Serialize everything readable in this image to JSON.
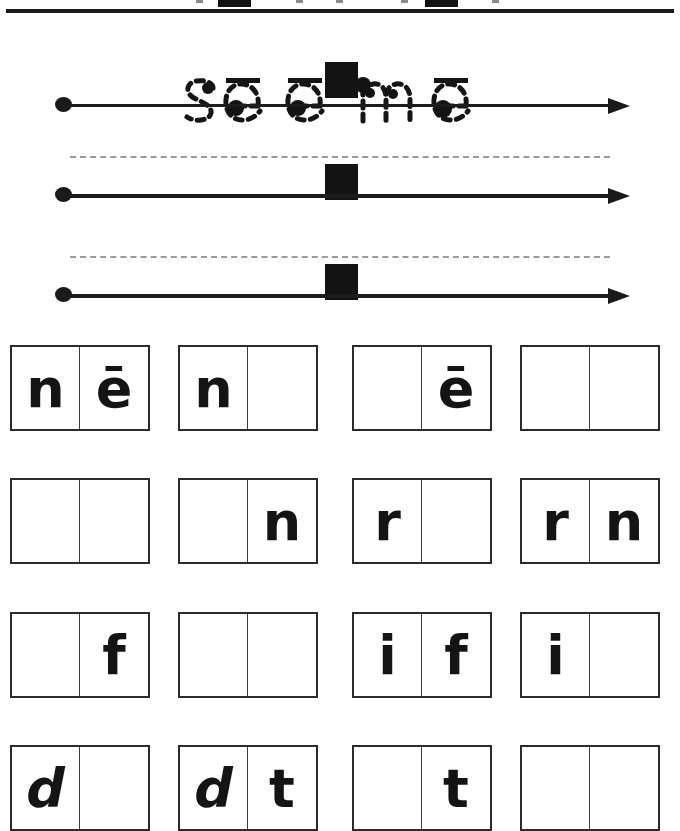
{
  "worksheet": {
    "title": "see me",
    "kind": "handwriting-and-word-building-worksheet",
    "ink_color": "#141414",
    "paper_color": "#ffffff",
    "guide_color": "#9a9a9a"
  },
  "top_strip": {
    "description": "cut-off bottom edge of the row above",
    "squares": [
      {
        "x": 218
      },
      {
        "x": 425
      }
    ],
    "ticks": [
      {
        "x": 196
      },
      {
        "x": 296
      },
      {
        "x": 336
      },
      {
        "x": 401
      },
      {
        "x": 492
      }
    ],
    "rule": {
      "x": 6,
      "y": 9,
      "width": 668,
      "height": 4
    }
  },
  "practice_lines": [
    {
      "index": 1,
      "has_traced_word": true,
      "traced_word": "see me",
      "baseline_y": 88,
      "midline": false,
      "separator_square": {
        "x": 325,
        "y": 46
      },
      "arrow": true,
      "start_dot": true
    },
    {
      "index": 2,
      "has_traced_word": false,
      "traced_word": "",
      "baseline_y": 178,
      "midline": true,
      "midline_y": 140,
      "separator_square": {
        "x": 325,
        "y": 148
      },
      "arrow": true,
      "start_dot": true
    },
    {
      "index": 3,
      "has_traced_word": false,
      "traced_word": "",
      "baseline_y": 278,
      "midline": true,
      "midline_y": 240,
      "separator_square": {
        "x": 325,
        "y": 248
      },
      "arrow": true,
      "start_dot": true
    }
  ],
  "traced_word": {
    "text": "see me",
    "word_1": "see",
    "word_2": "me",
    "letters": [
      {
        "char": "s",
        "macron": false,
        "start_dot": true
      },
      {
        "char": "e",
        "macron": true,
        "start_dot": true
      },
      {
        "char": "e",
        "macron": true,
        "start_dot": true
      },
      {
        "char": "m",
        "macron": false,
        "start_dot": true
      },
      {
        "char": "e",
        "macron": true,
        "start_dot": true
      }
    ]
  },
  "letter_grid": {
    "columns": 4,
    "rows": 4,
    "cells_per_box": 2,
    "row_labels": [
      "ne",
      "rn",
      "if",
      "dt"
    ],
    "rows_data": [
      {
        "row": 1,
        "boxes": [
          {
            "left": "n",
            "right": "ē"
          },
          {
            "left": "n",
            "right": ""
          },
          {
            "left": "",
            "right": "ē"
          },
          {
            "left": "",
            "right": ""
          }
        ]
      },
      {
        "row": 2,
        "boxes": [
          {
            "left": "",
            "right": ""
          },
          {
            "left": "",
            "right": "n"
          },
          {
            "left": "r",
            "right": ""
          },
          {
            "left": "r",
            "right": "n"
          }
        ]
      },
      {
        "row": 3,
        "boxes": [
          {
            "left": "",
            "right": "f"
          },
          {
            "left": "",
            "right": ""
          },
          {
            "left": "i",
            "right": "f"
          },
          {
            "left": "i",
            "right": ""
          }
        ]
      },
      {
        "row": 4,
        "boxes": [
          {
            "left": "d",
            "right": ""
          },
          {
            "left": "d",
            "right": "t"
          },
          {
            "left": "",
            "right": "t"
          },
          {
            "left": "",
            "right": ""
          }
        ]
      }
    ],
    "geometry": {
      "box_x": [
        10,
        178,
        352,
        520
      ],
      "box_width": 140,
      "row_y": [
        345,
        478,
        612,
        745
      ],
      "row_height": 86
    }
  }
}
